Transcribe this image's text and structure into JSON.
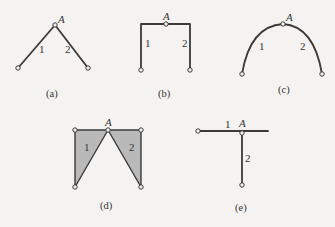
{
  "figure": {
    "joint_label": "A",
    "panels": [
      {
        "id": "a",
        "caption": "(a)",
        "type": "inclined-bars",
        "member_labels": [
          "1",
          "2"
        ]
      },
      {
        "id": "b",
        "caption": "(b)",
        "type": "portal-frame",
        "member_labels": [
          "1",
          "2"
        ]
      },
      {
        "id": "c",
        "caption": "(c)",
        "type": "curved-arch",
        "member_labels": [
          "1",
          "2"
        ]
      },
      {
        "id": "d",
        "caption": "(d)",
        "type": "triangular-plates",
        "member_labels": [
          "1",
          "2"
        ]
      },
      {
        "id": "e",
        "caption": "(e)",
        "type": "t-joint",
        "member_labels": [
          "1",
          "2"
        ]
      }
    ]
  },
  "colors": {
    "line": "#3a3a3a",
    "plate_fill": "#b9b9b9",
    "background": "#f4f3f1"
  }
}
